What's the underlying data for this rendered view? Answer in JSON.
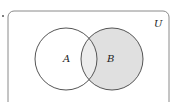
{
  "diagram": {
    "type": "venn",
    "universe_label": "U",
    "sets": [
      {
        "name": "A",
        "label": "A",
        "shaded": false
      },
      {
        "name": "B",
        "label": "B",
        "shaded": true
      }
    ],
    "shaded_region": "B",
    "colors": {
      "border": "#555555",
      "shade": "#e0e0e0",
      "intersection_shade": "#ececec",
      "background": "#ffffff"
    }
  }
}
